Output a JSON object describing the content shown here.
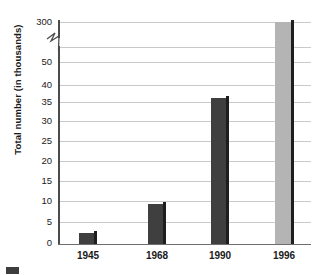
{
  "chart_data": {
    "type": "bar",
    "title": "",
    "xlabel": "",
    "ylabel": "Total number (in thousands)",
    "categories": [
      "1945",
      "1968",
      "1990",
      "1996"
    ],
    "values": [
      3,
      11,
      40,
      300
    ],
    "series": [
      {
        "name": "Total number (in thousands)",
        "values": [
          3,
          11,
          40,
          300
        ]
      }
    ],
    "ylim": [
      0,
      300
    ],
    "axis_break": {
      "present": true,
      "below": 50,
      "above": 300,
      "note": "y-axis broken between 50 and 300"
    },
    "yticks": [
      "0",
      "5",
      "10",
      "15",
      "20",
      "25",
      "30",
      "35",
      "40",
      "50",
      "300"
    ],
    "ytick_values": [
      0,
      5,
      10,
      15,
      20,
      25,
      30,
      35,
      40,
      50,
      300
    ],
    "grid": true,
    "grid_axis": "y",
    "legend_position": "bottom-left",
    "bar_colors": [
      "#3f3f3f",
      "#3f3f3f",
      "#3f3f3f",
      "#b4b4b4"
    ],
    "bar_shadow_color": "#1e1e1e"
  },
  "axis": {
    "y_title": "Total number (in thousands)",
    "y_ticks": [
      {
        "label": "300",
        "value": 300
      },
      {
        "label": "50",
        "value": 50
      },
      {
        "label": "40",
        "value": 40
      },
      {
        "label": "35",
        "value": 35
      },
      {
        "label": "30",
        "value": 30
      },
      {
        "label": "25",
        "value": 25
      },
      {
        "label": "20",
        "value": 20
      },
      {
        "label": "15",
        "value": 15
      },
      {
        "label": "10",
        "value": 10
      },
      {
        "label": "5",
        "value": 5
      },
      {
        "label": "0",
        "value": 0
      }
    ],
    "x_ticks": [
      "1945",
      "1968",
      "1990",
      "1996"
    ]
  },
  "bars": [
    {
      "category": "1945",
      "value": 3,
      "color": "#3f3f3f"
    },
    {
      "category": "1968",
      "value": 11,
      "color": "#3f3f3f"
    },
    {
      "category": "1990",
      "value": 40,
      "color": "#3f3f3f"
    },
    {
      "category": "1996",
      "value": 300,
      "color": "#b4b4b4"
    }
  ],
  "legend": {
    "swatch_color": "#3d3d3d",
    "label": ""
  },
  "colors": {
    "bar_dark": "#3f3f3f",
    "bar_light": "#b4b4b4",
    "bar_edge": "#1e1e1e",
    "grid": "#c9c9c9",
    "axis": "#4c4c4c",
    "text": "#1a1a1a",
    "background": "#ffffff"
  }
}
